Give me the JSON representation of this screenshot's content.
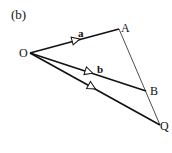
{
  "figure_label": "(b)",
  "points": {
    "O": {
      "label": "O",
      "x": 30,
      "y": 53
    },
    "A": {
      "label": "A",
      "x": 119,
      "y": 29
    },
    "B": {
      "label": "B",
      "x": 146,
      "y": 91
    },
    "Q": {
      "label": "Q",
      "x": 160,
      "y": 125
    }
  },
  "vectors": [
    {
      "from": "O",
      "to": "A",
      "label": "a",
      "arrow_at": [
        75,
        40
      ]
    },
    {
      "from": "O",
      "to": "B",
      "label": "b",
      "arrow_at": [
        89,
        73
      ]
    },
    {
      "from": "O",
      "to": "Q",
      "label": "",
      "arrow_at": [
        92,
        88
      ]
    }
  ],
  "thin_line": {
    "from": "A",
    "to": "Q",
    "passes_through": "B"
  },
  "colors": {
    "line": "#111111",
    "background": "#ffffff"
  }
}
